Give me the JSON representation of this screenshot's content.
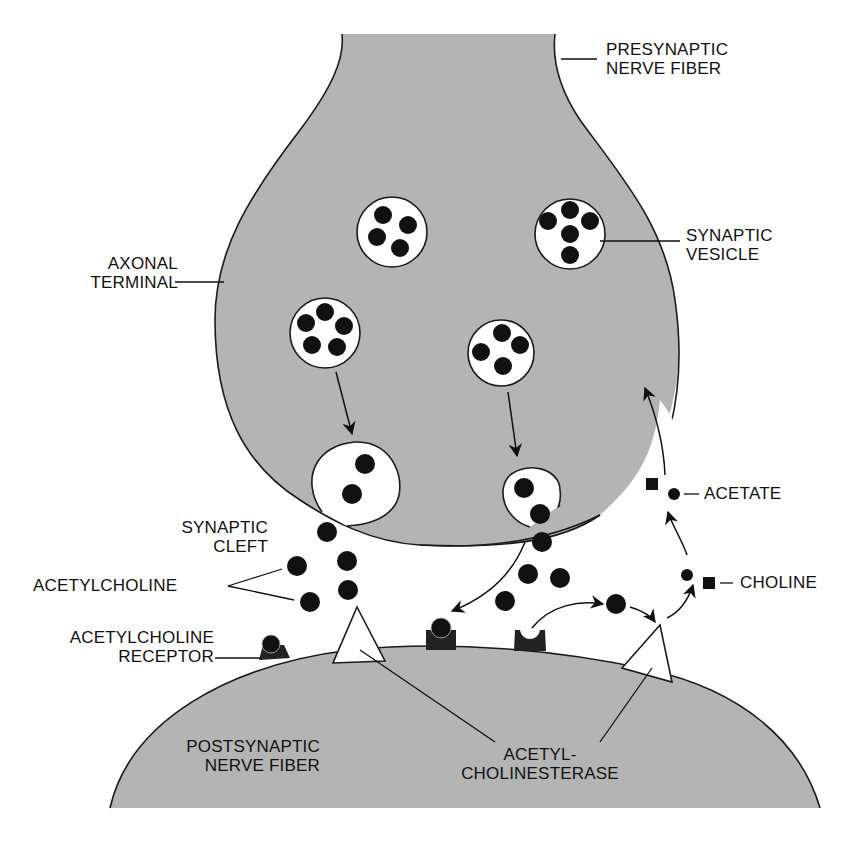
{
  "diagram": {
    "labels": {
      "presynaptic": [
        "PRESYNAPTIC",
        "NERVE FIBER"
      ],
      "axonal_terminal": [
        "AXONAL",
        "TERMINAL"
      ],
      "synaptic_vesicle": [
        "SYNAPTIC",
        "VESICLE"
      ],
      "synaptic_cleft": [
        "SYNAPTIC",
        "CLEFT"
      ],
      "acetylcholine": "ACETYLCHOLINE",
      "ach_receptor": [
        "ACETYLCHOLINE",
        "RECEPTOR"
      ],
      "acetate": "ACETATE",
      "choline": "CHOLINE",
      "postsynaptic": [
        "POSTSYNAPTIC",
        "NERVE FIBER"
      ],
      "acetylcholinesterase": [
        "ACETYL-",
        "CHOLINESTERASE"
      ]
    },
    "colors": {
      "nerve_fill": "#b4b4b4",
      "outline": "#1a1a1a",
      "molecule": "#111111",
      "vesicle_fill": "#ffffff",
      "background": "#ffffff"
    },
    "elements": {
      "vesicles_in_terminal": 4,
      "fusing_vesicles": 2,
      "receptors": 3,
      "enzymes": 2
    }
  }
}
